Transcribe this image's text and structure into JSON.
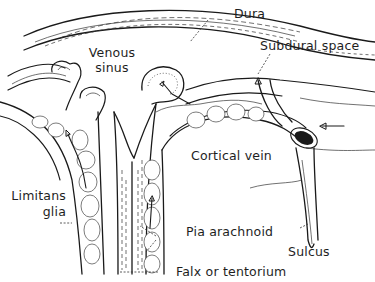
{
  "figure": {
    "type": "anatomical cross-section illustration",
    "style": "black line drawing on white",
    "labels": {
      "dura": "Dura",
      "subdural_space": "Subdural space",
      "venous_sinus": "Venous sinus",
      "cortical_vein": "Cortical vein",
      "limitans_glia": "Limitans glia",
      "pia_arachnoid": "Pia arachnoid",
      "sulcus": "Sulcus",
      "falx_or_tentorium": "Falx or tentorium"
    },
    "colors": {
      "ink": "#1a1a1a",
      "background": "#ffffff"
    }
  }
}
